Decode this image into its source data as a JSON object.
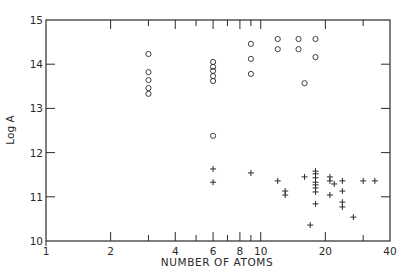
{
  "chart_data": {
    "type": "scatter",
    "title": "",
    "xlabel": "NUMBER OF ATOMS",
    "ylabel": "Log A",
    "xscale": "log",
    "xlim": [
      1,
      40
    ],
    "ylim": [
      10,
      15
    ],
    "x_tick_labels": [
      {
        "value": 1,
        "label": "1"
      },
      {
        "value": 2,
        "label": "2"
      },
      {
        "value": 4,
        "label": "4"
      },
      {
        "value": 6,
        "label": "6"
      },
      {
        "value": 8,
        "label": "8"
      },
      {
        "value": 10,
        "label": "10"
      },
      {
        "value": 20,
        "label": "20"
      },
      {
        "value": 40,
        "label": "40"
      }
    ],
    "x_minor_ticks": [
      3,
      5,
      7,
      9,
      30
    ],
    "y_tick_labels": [
      {
        "value": 10,
        "label": "10"
      },
      {
        "value": 11,
        "label": "11"
      },
      {
        "value": 12,
        "label": "12"
      },
      {
        "value": 13,
        "label": "13"
      },
      {
        "value": 14,
        "label": "14"
      },
      {
        "value": 15,
        "label": "15"
      }
    ],
    "grid": false,
    "legend": null,
    "series": [
      {
        "name": "circles",
        "marker": "o",
        "points": [
          [
            3,
            14.23
          ],
          [
            3,
            13.82
          ],
          [
            3,
            13.64
          ],
          [
            3,
            13.46
          ],
          [
            3,
            13.33
          ],
          [
            6,
            14.05
          ],
          [
            6,
            13.94
          ],
          [
            6,
            13.85
          ],
          [
            6,
            13.73
          ],
          [
            6,
            13.62
          ],
          [
            6,
            12.38
          ],
          [
            9,
            14.46
          ],
          [
            9,
            14.12
          ],
          [
            9,
            13.78
          ],
          [
            12,
            14.57
          ],
          [
            12,
            14.34
          ],
          [
            15,
            14.57
          ],
          [
            15,
            14.34
          ],
          [
            16,
            13.57
          ],
          [
            18,
            14.57
          ],
          [
            18,
            14.16
          ]
        ]
      },
      {
        "name": "crosses",
        "marker": "+",
        "points": [
          [
            6,
            11.63
          ],
          [
            6,
            11.33
          ],
          [
            9,
            11.54
          ],
          [
            12,
            11.36
          ],
          [
            13,
            11.13
          ],
          [
            13,
            11.04
          ],
          [
            16,
            11.45
          ],
          [
            17,
            10.36
          ],
          [
            18,
            11.58
          ],
          [
            18,
            11.52
          ],
          [
            18,
            11.43
          ],
          [
            18,
            11.33
          ],
          [
            18,
            11.27
          ],
          [
            18,
            11.2
          ],
          [
            18,
            11.11
          ],
          [
            18,
            10.84
          ],
          [
            21,
            11.45
          ],
          [
            21,
            11.36
          ],
          [
            21,
            11.04
          ],
          [
            22,
            11.29
          ],
          [
            24,
            11.36
          ],
          [
            24,
            11.13
          ],
          [
            24,
            10.88
          ],
          [
            24,
            10.77
          ],
          [
            27,
            10.54
          ],
          [
            30,
            11.36
          ],
          [
            34,
            11.36
          ]
        ]
      }
    ]
  }
}
